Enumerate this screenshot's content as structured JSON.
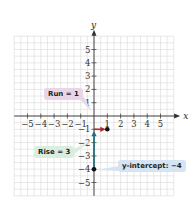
{
  "chart_data": {
    "type": "line",
    "title": "",
    "xlabel": "x",
    "ylabel": "y",
    "xlim": [
      -5,
      5
    ],
    "ylim": [
      -5,
      5
    ],
    "grid": true,
    "x_ticks": [
      "-5",
      "-4",
      "-3",
      "-2",
      "-1",
      "1",
      "2",
      "3",
      "4",
      "5"
    ],
    "y_ticks": [
      "5",
      "4",
      "3",
      "2",
      "1",
      "-1",
      "-2",
      "-3",
      "-4",
      "-5"
    ],
    "points": [
      {
        "x": 0,
        "y": -4,
        "label": "y-intercept"
      },
      {
        "x": 1,
        "y": -1
      }
    ],
    "segments": [
      {
        "name": "rise",
        "from": [
          0,
          -4
        ],
        "to": [
          0,
          -1
        ],
        "color": "#1f6f7f",
        "arrow": true
      },
      {
        "name": "run",
        "from": [
          0,
          -1
        ],
        "to": [
          1,
          -1
        ],
        "color": "#b22a2a",
        "arrow": true
      }
    ],
    "annotations": [
      {
        "text": "Run = 1",
        "bg": "#e8d6e6"
      },
      {
        "text": "Rise = 3",
        "bg": "#d9eede"
      },
      {
        "text": "y-intercept: −4",
        "bg": "#d4e4f3"
      }
    ]
  },
  "labels": {
    "x_axis": "x",
    "y_axis": "y",
    "run": "Run = 1",
    "rise": "Rise = 3",
    "intercept": "y-intercept: −4"
  },
  "colors": {
    "grid": "#d9d9d9",
    "axis": "#333333",
    "rise": "#1f6f7f",
    "run": "#b22a2a",
    "point": "#111111"
  }
}
